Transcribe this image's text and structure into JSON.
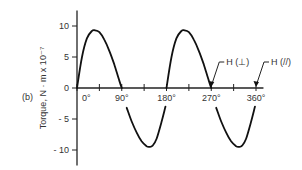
{
  "chart_data": {
    "type": "line",
    "panel_label": "(b)",
    "title": "",
    "xlabel": "",
    "ylabel": "Torque, N · m x 10⁻⁷",
    "xlim": [
      0,
      360
    ],
    "ylim": [
      -12,
      12
    ],
    "x_ticks": [
      0,
      45,
      90,
      135,
      180,
      225,
      270,
      315,
      360
    ],
    "x_tick_labels": [
      {
        "value": 0,
        "label": "0°"
      },
      {
        "value": 90,
        "label": "90°"
      },
      {
        "value": 180,
        "label": "180°"
      },
      {
        "value": 270,
        "label": "270°"
      },
      {
        "value": 360,
        "label": "360°"
      }
    ],
    "y_ticks": [
      {
        "value": 10,
        "label": "10"
      },
      {
        "value": 5,
        "label": "5"
      },
      {
        "value": 0,
        "label": "0"
      },
      {
        "value": -5,
        "label": "- 5"
      },
      {
        "value": -10,
        "label": "- 10"
      }
    ],
    "grid": false,
    "series": [
      {
        "name": "torque",
        "segments": [
          {
            "x": [
              0,
              10,
              20,
              30,
              36,
              45,
              55,
              65,
              75,
              85,
              90
            ],
            "y": [
              0,
              5.0,
              8.0,
              9.2,
              9.3,
              9.0,
              7.8,
              6.0,
              3.8,
              1.2,
              0
            ]
          },
          {
            "x": [
              100,
              110,
              120,
              130,
              140,
              146,
              152,
              160,
              170,
              178
            ],
            "y": [
              -3.2,
              -5.4,
              -7.2,
              -8.6,
              -9.4,
              -9.5,
              -9.3,
              -8.2,
              -5.5,
              -3.0
            ]
          },
          {
            "x": [
              180,
              190,
              200,
              210,
              216,
              225,
              235,
              245,
              255,
              265,
              270
            ],
            "y": [
              0,
              5.0,
              8.0,
              9.2,
              9.3,
              9.0,
              7.8,
              6.0,
              3.8,
              1.2,
              0
            ]
          },
          {
            "x": [
              280,
              290,
              300,
              310,
              320,
              326,
              332,
              340,
              350,
              358
            ],
            "y": [
              -3.2,
              -5.4,
              -7.2,
              -8.6,
              -9.4,
              -9.5,
              -9.3,
              -8.2,
              -5.5,
              -3.0
            ]
          }
        ]
      }
    ],
    "annotations": [
      {
        "text": "H (⊥)",
        "points_to": {
          "x": 270,
          "y": 0
        }
      },
      {
        "text": "H (//)",
        "points_to": {
          "x": 360,
          "y": 0
        }
      }
    ]
  }
}
